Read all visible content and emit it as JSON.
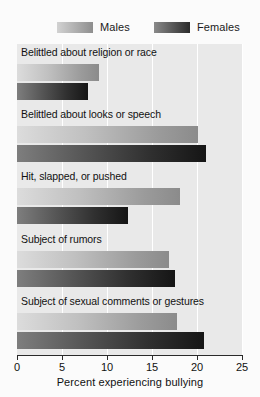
{
  "chart_data": {
    "type": "bar",
    "orientation": "horizontal",
    "title": "",
    "xlabel": "Percent experiencing bullying",
    "ylabel": "",
    "xlim": [
      0,
      25
    ],
    "xticks": [
      0,
      5,
      10,
      15,
      20,
      25
    ],
    "xtick_labels": [
      "0",
      "5",
      "10",
      "15",
      "20",
      "25"
    ],
    "grid": true,
    "legend_position": "top",
    "categories": [
      "Belittled about religion or race",
      "Belittled about looks or speech",
      "Hit, slapped, or pushed",
      "Subject of rumors",
      "Subject of sexual comments or gestures"
    ],
    "series": [
      {
        "name": "Males",
        "color": "#a8a8a8",
        "values": [
          9.1,
          20.1,
          18.1,
          16.9,
          17.8
        ]
      },
      {
        "name": "Females",
        "color": "#383838",
        "values": [
          7.9,
          21.0,
          12.3,
          17.6,
          20.8
        ]
      }
    ]
  },
  "legend": {
    "males_label": "Males",
    "females_label": "Females"
  },
  "axis": {
    "xlabel": "Percent experiencing bullying"
  }
}
